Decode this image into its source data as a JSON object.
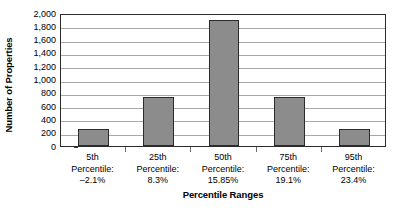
{
  "chart_data": {
    "type": "bar",
    "title": "",
    "xlabel": "Percentile Ranges",
    "ylabel": "Number of Properties",
    "categories": [
      "5th Percentile: –2.1%",
      "25th Percentile: 8.3%",
      "50th Percentile: 15.85%",
      "75th Percentile: 19.1%",
      "95th Percentile: 23.4%"
    ],
    "category_lines": [
      [
        "5th",
        "Percentile:",
        "–2.1%"
      ],
      [
        "25th",
        "Percentile:",
        "8.3%"
      ],
      [
        "50th",
        "Percentile:",
        "15.85%"
      ],
      [
        "75th",
        "Percentile:",
        "19.1%"
      ],
      [
        "95th",
        "Percentile:",
        "23.4%"
      ]
    ],
    "values": [
      250,
      740,
      1890,
      740,
      250
    ],
    "ylim": [
      0,
      2000
    ],
    "ytick_values": [
      0,
      200,
      400,
      600,
      800,
      1000,
      1200,
      1400,
      1600,
      1800,
      2000
    ],
    "ytick_labels": [
      "0",
      "200",
      "400",
      "600",
      "800",
      "1,000",
      "1,200",
      "1,400",
      "1,600",
      "1,800",
      "2,000"
    ],
    "grid": true,
    "legend": false,
    "legend_position": "none",
    "series_color": "#8c8c8c",
    "bar_edge_color": "#2b2b2b",
    "gridline_color": "#a8a8a8",
    "axis_color": "#2b2b2b",
    "background_color": "#ffffff"
  }
}
